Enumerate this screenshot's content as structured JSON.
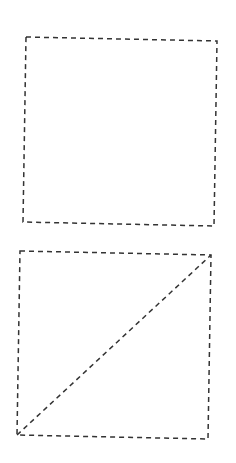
{
  "canvas": {
    "width": 236,
    "height": 463,
    "background": "#ffffff"
  },
  "style": {
    "stroke": "#333333",
    "stroke_width": 1.5,
    "dasharray": "5 4"
  },
  "shapes": [
    {
      "id": "square-top",
      "type": "quadrilateral",
      "points": [
        [
          26,
          37
        ],
        [
          217,
          41
        ],
        [
          214,
          226
        ],
        [
          23,
          222
        ]
      ],
      "diagonals": []
    },
    {
      "id": "square-bottom",
      "type": "quadrilateral",
      "points": [
        [
          20,
          251
        ],
        [
          211,
          255
        ],
        [
          208,
          439
        ],
        [
          17,
          435
        ]
      ],
      "diagonals": [
        {
          "from": [
            17,
            435
          ],
          "to": [
            211,
            255
          ]
        }
      ]
    }
  ]
}
